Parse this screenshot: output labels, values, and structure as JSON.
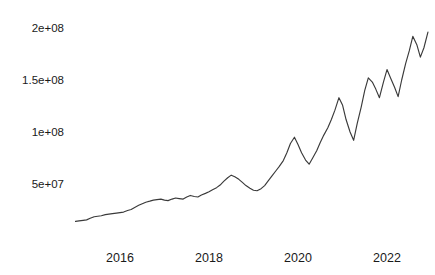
{
  "chart_data": {
    "type": "line",
    "title": "",
    "subtitle": "",
    "xlabel": "",
    "ylabel": "",
    "grid": false,
    "legend": null,
    "legend_position": "none",
    "xlim": [
      2015.0,
      2023.0
    ],
    "ylim": [
      0,
      215000000
    ],
    "y_ticks": [
      {
        "label": "5e+07",
        "value": 50000000
      },
      {
        "label": "1e+08",
        "value": 100000000
      },
      {
        "label": "1.5e+08",
        "value": 150000000
      },
      {
        "label": "2e+08",
        "value": 200000000
      }
    ],
    "x_ticks": [
      {
        "label": "2016",
        "value": 2016
      },
      {
        "label": "2018",
        "value": 2018
      },
      {
        "label": "2020",
        "value": 2020
      },
      {
        "label": "2022",
        "value": 2022
      }
    ],
    "line_color": "#3a3a3a",
    "series": [
      {
        "name": "value",
        "x": [
          2015.0,
          2015.08,
          2015.17,
          2015.25,
          2015.33,
          2015.42,
          2015.5,
          2015.58,
          2015.67,
          2015.75,
          2015.83,
          2015.92,
          2016.0,
          2016.08,
          2016.17,
          2016.25,
          2016.33,
          2016.42,
          2016.5,
          2016.58,
          2016.67,
          2016.75,
          2016.83,
          2016.92,
          2017.0,
          2017.08,
          2017.17,
          2017.25,
          2017.33,
          2017.42,
          2017.5,
          2017.58,
          2017.67,
          2017.75,
          2017.83,
          2017.92,
          2018.0,
          2018.08,
          2018.17,
          2018.25,
          2018.33,
          2018.42,
          2018.5,
          2018.58,
          2018.67,
          2018.75,
          2018.83,
          2018.92,
          2019.0,
          2019.08,
          2019.17,
          2019.25,
          2019.33,
          2019.42,
          2019.5,
          2019.58,
          2019.67,
          2019.75,
          2019.83,
          2019.92,
          2020.0,
          2020.08,
          2020.17,
          2020.25,
          2020.33,
          2020.42,
          2020.5,
          2020.58,
          2020.67,
          2020.75,
          2020.83,
          2020.92,
          2021.0,
          2021.08,
          2021.17,
          2021.25,
          2021.33,
          2021.42,
          2021.5,
          2021.58,
          2021.67,
          2021.75,
          2021.83,
          2021.92,
          2022.0,
          2022.08,
          2022.17,
          2022.25,
          2022.33,
          2022.42,
          2022.5,
          2022.58,
          2022.67,
          2022.75,
          2022.83,
          2022.92
        ],
        "values": [
          14000000,
          14500000,
          15000000,
          15500000,
          17000000,
          18500000,
          19000000,
          19500000,
          20500000,
          21000000,
          21500000,
          22000000,
          22500000,
          23000000,
          24500000,
          25500000,
          27500000,
          29500000,
          31000000,
          32500000,
          33500000,
          34500000,
          35000000,
          35500000,
          34500000,
          34000000,
          35500000,
          36500000,
          36000000,
          35500000,
          37500000,
          39000000,
          38000000,
          37500000,
          39500000,
          41000000,
          42500000,
          44500000,
          46500000,
          49000000,
          52500000,
          56000000,
          58500000,
          57000000,
          54500000,
          51500000,
          48500000,
          46000000,
          44000000,
          43500000,
          45500000,
          48500000,
          53000000,
          58000000,
          62500000,
          67000000,
          72500000,
          80000000,
          89000000,
          95000000,
          88000000,
          80000000,
          73000000,
          69000000,
          75000000,
          82000000,
          90000000,
          97000000,
          104000000,
          112000000,
          121000000,
          133000000,
          126000000,
          112000000,
          100000000,
          92000000,
          108000000,
          124000000,
          140000000,
          152000000,
          148000000,
          141000000,
          133000000,
          148000000,
          160000000,
          152000000,
          143000000,
          134000000,
          150000000,
          166000000,
          178000000,
          192000000,
          184000000,
          172000000,
          181000000,
          196000000
        ]
      }
    ]
  }
}
